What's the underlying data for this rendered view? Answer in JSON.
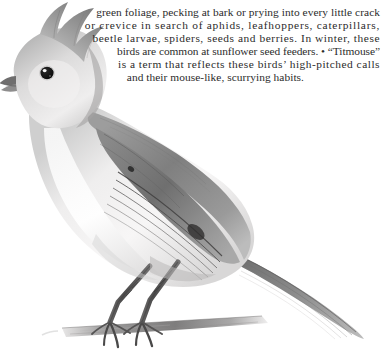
{
  "page": {
    "background_color": "#ffffff",
    "text_color": "#2b2b2b",
    "width": 386,
    "height": 351
  },
  "body_text": {
    "clipped_top_line": "",
    "lines": [
      "green foliage, pecking at bark or prying into every little crack",
      "or crevice in search of aphids, leafhoppers, caterpillars,",
      "beetle larvae, spiders, seeds and berries. In winter, these",
      "birds are common at sunflower seed feeders. • “Titmouse”",
      "is a term that reflects these birds’ high-pitched calls",
      "and their mouse-like, scurrying habits."
    ]
  },
  "illustration": {
    "subject": "titmouse",
    "description": "graphite pencil drawing of a crested titmouse perched on a branch, facing left",
    "style": "pencil-drawing",
    "colors": {
      "dark": "#3b3b3b",
      "mid": "#8d8d8d",
      "light": "#c9c9c9",
      "pale": "#eceaea",
      "eye": "#1a1a1a",
      "catchlight": "#ffffff"
    }
  }
}
